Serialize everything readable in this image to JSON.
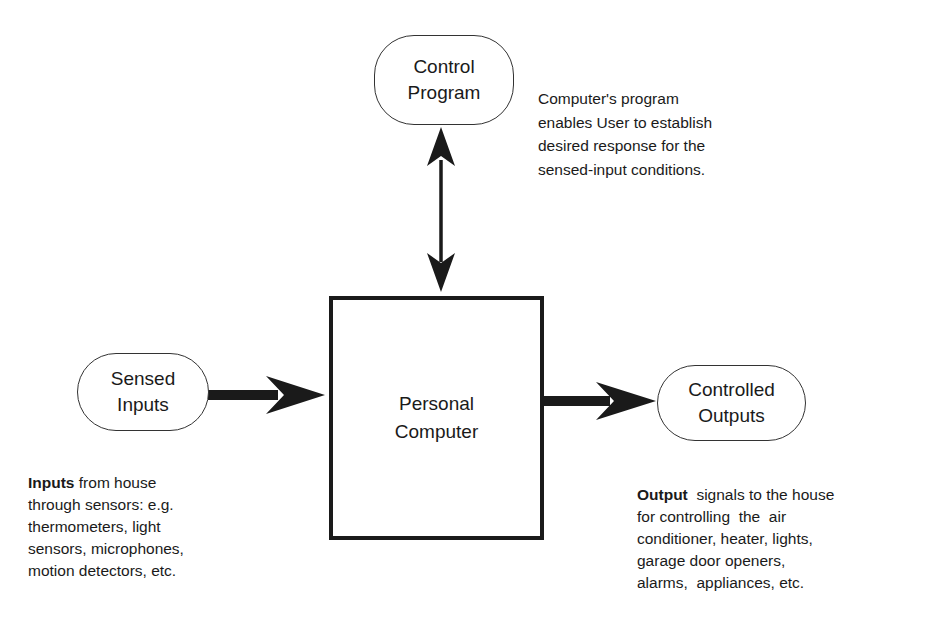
{
  "diagram": {
    "nodes": {
      "control_program": {
        "line1": "Control",
        "line2": "Program"
      },
      "personal_computer": {
        "line1": "Personal",
        "line2": "Computer"
      },
      "sensed_inputs": {
        "line1": "Sensed",
        "line2": "Inputs"
      },
      "controlled_outputs": {
        "line1": "Controlled",
        "line2": "Outputs"
      }
    },
    "edges": [
      {
        "from": "control_program",
        "to": "personal_computer",
        "type": "bidirectional"
      },
      {
        "from": "sensed_inputs",
        "to": "personal_computer",
        "type": "directed"
      },
      {
        "from": "personal_computer",
        "to": "controlled_outputs",
        "type": "directed"
      }
    ],
    "notes": {
      "program": {
        "lines": [
          "Computer's program",
          "enables User to establish",
          "desired response for the",
          "sensed-input conditions."
        ]
      },
      "inputs": {
        "bold": "Inputs",
        "lines": [
          " from house",
          "through sensors: e.g.",
          "thermometers, light",
          "sensors, microphones,",
          "motion detectors, etc."
        ]
      },
      "outputs": {
        "bold": "Output",
        "lines": [
          "  signals to the house",
          "for controlling  the  air",
          "conditioner, heater, lights,",
          "garage door openers,",
          "alarms,  appliances, etc."
        ]
      }
    }
  }
}
